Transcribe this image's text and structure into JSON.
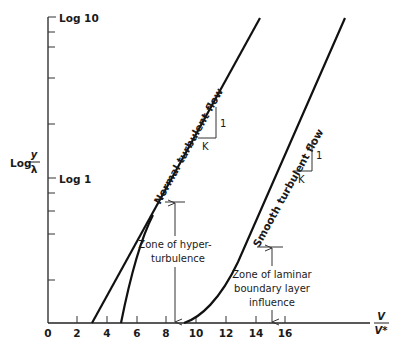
{
  "diagram": {
    "y_axis": {
      "label_main": "Log",
      "label_num": "y",
      "label_den": "λ",
      "tick_labels": [
        "Log 10",
        "Log 1"
      ]
    },
    "x_axis": {
      "label_num": "V",
      "label_den": "V*",
      "tick_labels": [
        "0",
        "2",
        "4",
        "6",
        "8",
        "10",
        "12",
        "14",
        "16"
      ]
    },
    "curves": {
      "normal": "Normal turbulent flow",
      "smooth": "Smooth turbulent flow"
    },
    "slope_markers": {
      "normal": {
        "rise": "1",
        "run": "K"
      },
      "smooth": {
        "rise": "1",
        "run": "K"
      }
    },
    "zones": {
      "hyper_line1": "Zone of hyper-",
      "hyper_line2": "turbulence",
      "laminar_line1": "Zone of laminar",
      "laminar_line2": "boundary layer",
      "laminar_line3": "influence"
    },
    "colors": {
      "ink": "#111111",
      "background": "#ffffff"
    }
  }
}
